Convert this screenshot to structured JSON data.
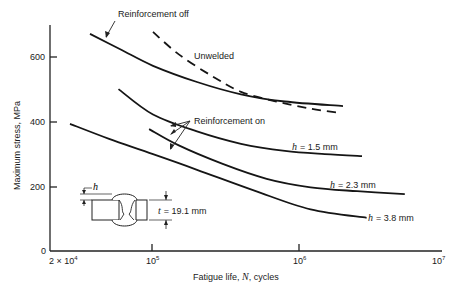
{
  "chart_data": {
    "type": "line",
    "title": "",
    "xlabel": "Fatigue life, N, cycles",
    "ylabel": "Maximum stress, MPa",
    "x_scale": "log",
    "xlim": [
      20000,
      10000000
    ],
    "ylim": [
      0,
      700
    ],
    "grid": false,
    "x_ticks": [
      {
        "value": 20000,
        "label": "2 × 10",
        "exp": "4"
      },
      {
        "value": 100000,
        "label": "10",
        "exp": "5"
      },
      {
        "value": 1000000,
        "label": "10",
        "exp": "6"
      },
      {
        "value": 10000000,
        "label": "10",
        "exp": "7"
      }
    ],
    "y_ticks": [
      0,
      200,
      400,
      600
    ],
    "series": [
      {
        "name": "Reinforcement off",
        "style": "solid",
        "x": [
          37000,
          60000,
          100000,
          200000,
          400000,
          800000,
          2000000
        ],
        "y": [
          668,
          620,
          570,
          520,
          482,
          460,
          446
        ]
      },
      {
        "name": "Unwelded",
        "style": "dashed",
        "x": [
          100000,
          150000,
          250000,
          400000,
          700000,
          1200000,
          1900000
        ],
        "y": [
          674,
          605,
          540,
          490,
          460,
          438,
          425
        ]
      },
      {
        "name": "h = 1.5 mm",
        "style": "solid",
        "x": [
          58000,
          100000,
          200000,
          400000,
          800000,
          1500000,
          2700000
        ],
        "y": [
          498,
          420,
          368,
          330,
          308,
          298,
          292
        ]
      },
      {
        "name": "h = 2.3 mm",
        "style": "solid",
        "x": [
          94000,
          150000,
          300000,
          600000,
          1200000,
          2500000,
          5300000
        ],
        "y": [
          375,
          325,
          268,
          222,
          196,
          184,
          175
        ]
      },
      {
        "name": "h = 3.8 mm",
        "style": "solid",
        "x": [
          27000,
          50000,
          100000,
          200000,
          500000,
          1200000,
          2900000
        ],
        "y": [
          391,
          345,
          298,
          250,
          185,
          128,
          102
        ]
      }
    ],
    "annotations": [
      {
        "text": "Reinforcement off",
        "target": "Reinforcement off"
      },
      {
        "text": "Unwelded",
        "target": "Unwelded"
      },
      {
        "text": "Reinforcement on",
        "target": [
          "h = 1.5 mm",
          "h = 2.3 mm",
          "h = 3.8 mm"
        ]
      },
      {
        "text": "h = 1.5 mm"
      },
      {
        "text": "h = 2.3 mm"
      },
      {
        "text": "h = 3.8 mm"
      },
      {
        "text": "t = 19.1 mm",
        "note": "inset weld cross-section with reinforcement height h"
      }
    ]
  },
  "labels": {
    "reinf_off": "Reinforcement off",
    "unwelded": "Unwelded",
    "reinf_on": "Reinforcement on",
    "h15": "= 1.5 mm",
    "h23": "= 2.3 mm",
    "h38": "= 3.8 mm",
    "h_sym": "h",
    "t_sym": "t",
    "t_val": "= 19.1 mm",
    "y0": "0",
    "y200": "200",
    "y400": "400",
    "y600": "600",
    "x0": "2 × 10",
    "x0exp": "4",
    "x1": "10",
    "x1exp": "5",
    "x2": "10",
    "x2exp": "6",
    "x3": "10",
    "x3exp": "7",
    "xlabel_pre": "Fatigue life, ",
    "xlabel_n": "N",
    "xlabel_post": ", cycles",
    "ylabel": "Maximum stress, MPa"
  }
}
